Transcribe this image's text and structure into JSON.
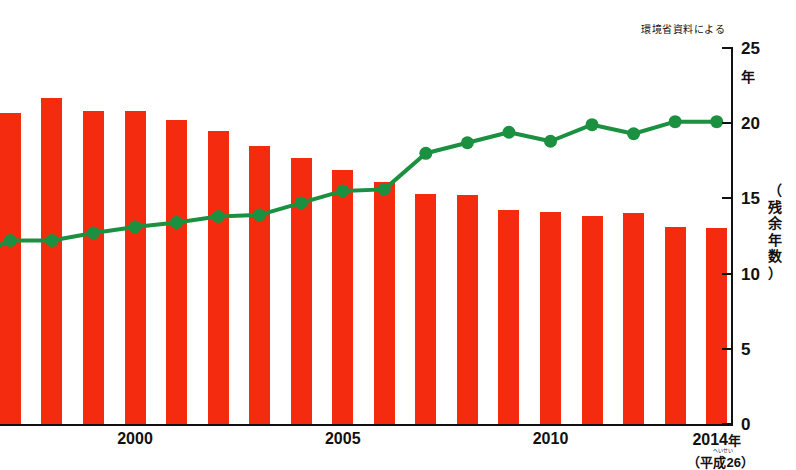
{
  "chart_data": {
    "type": "bar",
    "title": "",
    "source_note": "環境省資料による",
    "xlabel": "",
    "ylabel": "（残余年数）",
    "y_unit": "年",
    "ylim": [
      0,
      25
    ],
    "yticks": [
      0,
      5,
      10,
      15,
      20,
      25
    ],
    "ytick_labels": [
      "0",
      "5",
      "10",
      "15",
      "20",
      "25"
    ],
    "grid": false,
    "legend": "none",
    "x": [
      1996,
      1997,
      1998,
      1999,
      2000,
      2001,
      2002,
      2003,
      2004,
      2005,
      2006,
      2007,
      2008,
      2009,
      2010,
      2011,
      2012,
      2013,
      2014
    ],
    "xtick_labels": [
      "2000",
      "2005",
      "2010",
      "2014年"
    ],
    "xtick_values": [
      2000,
      2005,
      2010,
      2014
    ],
    "xtick_sub": "（平成26）",
    "xtick_sub_ruby": "へいせい",
    "series": [
      {
        "name": "最終処分場残余容量（棒）",
        "type": "bar",
        "color": "#F42B0E",
        "values": [
          20.7,
          20.7,
          21.7,
          20.8,
          20.8,
          20.2,
          19.5,
          18.5,
          17.7,
          16.9,
          16.1,
          15.3,
          15.2,
          14.2,
          14.1,
          13.8,
          14.0,
          13.1,
          13.0
        ]
      },
      {
        "name": "残余年数（折れ線）",
        "type": "line",
        "color": "#1B9040",
        "values": [
          11.0,
          12.2,
          12.2,
          12.7,
          13.1,
          13.4,
          13.8,
          13.9,
          14.7,
          15.5,
          15.6,
          18.0,
          18.7,
          19.4,
          18.8,
          19.9,
          19.3,
          20.1,
          20.1
        ]
      }
    ]
  },
  "yaxis_title_chars": [
    "（",
    "残",
    "余",
    "年",
    "数",
    "）"
  ],
  "yaxis_title_ruby": [
    "ざ",
    "ん",
    "よ",
    "ね",
    "す",
    "う"
  ]
}
